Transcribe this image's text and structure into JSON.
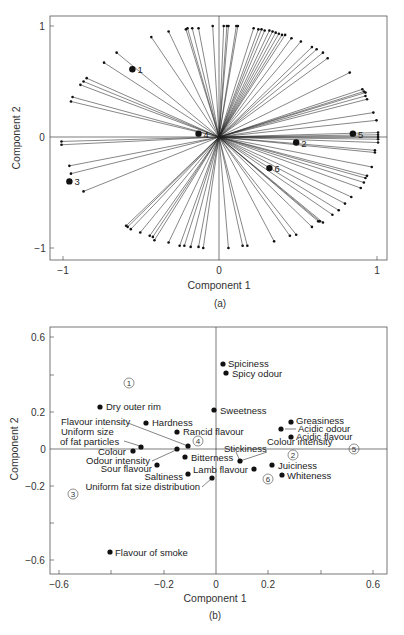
{
  "chart_data": [
    {
      "id": "a",
      "type": "scatter",
      "subtype": "biplot-loadings-vectors",
      "caption": "(a)",
      "xlabel": "Component 1",
      "ylabel": "Component 2",
      "xlim": [
        -1.1,
        1.07
      ],
      "ylim": [
        -1.1,
        1.09
      ],
      "xticks": [
        -1,
        0,
        1
      ],
      "xtick_labels": [
        "−1",
        "0",
        "1"
      ],
      "yticks": [
        -1,
        0,
        1
      ],
      "ytick_labels": [
        "−1",
        "0",
        "1"
      ],
      "grid": false,
      "reference_lines": {
        "x0": true,
        "y0": true
      },
      "labeled_points": [
        {
          "label": "1",
          "x": -0.55,
          "y": 0.61
        },
        {
          "label": "2",
          "x": 0.49,
          "y": -0.05
        },
        {
          "label": "3",
          "x": -0.95,
          "y": -0.4
        },
        {
          "label": "4",
          "x": -0.13,
          "y": 0.03
        },
        {
          "label": "5",
          "x": 0.85,
          "y": 0.03
        },
        {
          "label": "6",
          "x": 0.32,
          "y": -0.28
        }
      ],
      "vectors": [
        [
          -0.43,
          0.9
        ],
        [
          -0.32,
          0.95
        ],
        [
          -0.21,
          0.97
        ],
        [
          -0.2,
          0.98
        ],
        [
          -0.17,
          0.98
        ],
        [
          -0.13,
          0.98
        ],
        [
          -0.04,
          1.0
        ],
        [
          0.03,
          1.0
        ],
        [
          0.05,
          1.0
        ],
        [
          0.06,
          1.0
        ],
        [
          0.11,
          1.0
        ],
        [
          0.12,
          1.0
        ],
        [
          0.22,
          0.98
        ],
        [
          0.25,
          0.97
        ],
        [
          0.27,
          0.97
        ],
        [
          0.29,
          0.96
        ],
        [
          0.32,
          0.96
        ],
        [
          0.34,
          0.95
        ],
        [
          0.36,
          0.94
        ],
        [
          0.38,
          0.93
        ],
        [
          0.4,
          0.92
        ],
        [
          0.42,
          0.92
        ],
        [
          0.46,
          0.89
        ],
        [
          0.52,
          0.86
        ],
        [
          0.59,
          0.81
        ],
        [
          0.62,
          0.79
        ],
        [
          0.66,
          0.76
        ],
        [
          0.69,
          0.71
        ],
        [
          0.83,
          0.58
        ],
        [
          0.91,
          0.43
        ],
        [
          0.92,
          0.41
        ],
        [
          0.93,
          0.4
        ],
        [
          0.93,
          0.37
        ],
        [
          0.94,
          0.34
        ],
        [
          0.98,
          0.22
        ],
        [
          1.0,
          0.15
        ],
        [
          1.01,
          0.04
        ],
        [
          1.01,
          0.02
        ],
        [
          1.01,
          0.0
        ],
        [
          1.01,
          -0.02
        ],
        [
          1.01,
          -0.05
        ],
        [
          0.99,
          -0.12
        ],
        [
          0.99,
          -0.14
        ],
        [
          0.97,
          -0.27
        ],
        [
          0.94,
          -0.35
        ],
        [
          0.93,
          -0.37
        ],
        [
          0.92,
          -0.41
        ],
        [
          0.9,
          -0.46
        ],
        [
          0.84,
          -0.54
        ],
        [
          0.8,
          -0.6
        ],
        [
          0.76,
          -0.66
        ],
        [
          0.72,
          -0.7
        ],
        [
          0.66,
          -0.77
        ],
        [
          0.64,
          -0.76
        ],
        [
          0.63,
          -0.76
        ],
        [
          0.59,
          -0.81
        ],
        [
          0.49,
          -0.88
        ],
        [
          0.45,
          -0.89
        ],
        [
          0.35,
          -0.94
        ],
        [
          0.18,
          -0.98
        ],
        [
          0.15,
          -0.98
        ],
        [
          0.06,
          -1.0
        ],
        [
          -0.1,
          -1.0
        ],
        [
          -0.13,
          -0.99
        ],
        [
          -0.18,
          -0.99
        ],
        [
          -0.22,
          -0.98
        ],
        [
          -0.25,
          -0.98
        ],
        [
          -0.32,
          -0.95
        ],
        [
          -0.41,
          -0.93
        ],
        [
          -0.42,
          -0.9
        ],
        [
          -0.44,
          -0.89
        ],
        [
          -0.5,
          -0.86
        ],
        [
          -0.56,
          -0.83
        ],
        [
          -0.58,
          -0.81
        ],
        [
          -0.59,
          -0.8
        ],
        [
          -0.86,
          -0.49
        ],
        [
          -0.94,
          -0.33
        ],
        [
          -0.95,
          -0.26
        ],
        [
          -1.0,
          -0.07
        ],
        [
          -1.0,
          -0.04
        ],
        [
          -0.94,
          0.32
        ],
        [
          -0.93,
          0.36
        ],
        [
          -0.88,
          0.47
        ],
        [
          -0.86,
          0.5
        ],
        [
          -0.84,
          0.53
        ],
        [
          -0.73,
          0.67
        ],
        [
          -0.65,
          0.76
        ]
      ]
    },
    {
      "id": "b",
      "type": "scatter",
      "caption": "(b)",
      "xlabel": "Component 1",
      "ylabel": "Component 2",
      "xlim": [
        -0.63,
        0.66
      ],
      "ylim": [
        -0.67,
        0.65
      ],
      "xticks": [
        -0.6,
        -0.2,
        0,
        0.2,
        0.6
      ],
      "xtick_labels": [
        "−0.6",
        "−0.2",
        "0",
        "0.2",
        "0.6"
      ],
      "xticks_minor": [
        -0.4,
        0.4
      ],
      "yticks": [
        0.6,
        0.2,
        0,
        -0.2,
        -0.6
      ],
      "ytick_labels": [
        "0.6",
        "0.2",
        "0",
        "−0.2",
        "−0.6"
      ],
      "yticks_minor": [
        0.4,
        -0.4
      ],
      "grid": false,
      "reference_lines": {
        "x0": true,
        "y0": true
      },
      "points": [
        {
          "label": "Spiciness",
          "x": 0.03,
          "y": 0.46
        },
        {
          "label": "Spicy odour",
          "x": 0.04,
          "y": 0.41
        },
        {
          "label": "Dry outer rim",
          "x": -0.44,
          "y": 0.23
        },
        {
          "label": "Sweetness",
          "x": -0.01,
          "y": 0.21
        },
        {
          "label": "Hardness",
          "x": -0.27,
          "y": 0.14
        },
        {
          "label": "Rancid flavour",
          "x": -0.15,
          "y": 0.09
        },
        {
          "label": "Flavour intensity",
          "x": -0.11,
          "y": 0.02
        },
        {
          "label": "Uniform size of fat particles",
          "x": -0.29,
          "y": 0.01
        },
        {
          "label": "Colour",
          "x": -0.32,
          "y": -0.01
        },
        {
          "label": "Odour intensity",
          "x": -0.15,
          "y": 0.0
        },
        {
          "label": "Bitterness",
          "x": -0.12,
          "y": -0.04
        },
        {
          "label": "Sour flavour",
          "x": -0.23,
          "y": -0.09
        },
        {
          "label": "Saltiness",
          "x": -0.11,
          "y": -0.13
        },
        {
          "label": "Uniform fat size distribution",
          "x": -0.02,
          "y": -0.15
        },
        {
          "label": "Stickiness",
          "x": 0.09,
          "y": -0.07
        },
        {
          "label": "Colour intensity",
          "x": 0.09,
          "y": -0.07
        },
        {
          "label": "Lamb flavour",
          "x": 0.15,
          "y": -0.11
        },
        {
          "label": "Greasiness",
          "x": 0.29,
          "y": 0.15
        },
        {
          "label": "Acidic odour",
          "x": 0.25,
          "y": 0.11
        },
        {
          "label": "Acidic flavour",
          "x": 0.29,
          "y": 0.07
        },
        {
          "label": "Juiciness",
          "x": 0.21,
          "y": -0.09
        },
        {
          "label": "Whiteness",
          "x": 0.25,
          "y": -0.14
        },
        {
          "label": "Flavour of smoke",
          "x": -0.41,
          "y": -0.56
        }
      ],
      "sample_markers": [
        {
          "label": "1",
          "x": -0.33,
          "y": 0.36
        },
        {
          "label": "2",
          "x": 0.29,
          "y": -0.03
        },
        {
          "label": "3",
          "x": -0.55,
          "y": -0.24
        },
        {
          "label": "4",
          "x": -0.07,
          "y": 0.05
        },
        {
          "label": "5",
          "x": 0.53,
          "y": 0.01
        },
        {
          "label": "6",
          "x": 0.19,
          "y": -0.16
        }
      ]
    }
  ],
  "chart_a": {
    "caption": "(a)",
    "xlabel": "Component 1",
    "ylabel": "Component 2",
    "xticks": [
      "−1",
      "0",
      "1"
    ],
    "yticks": [
      "1",
      "0",
      "−1"
    ],
    "point_labels": [
      "1",
      "2",
      "3",
      "4",
      "5",
      "6"
    ]
  },
  "chart_b": {
    "caption": "(b)",
    "xlabel": "Component 1",
    "ylabel": "Component 2",
    "xticks": [
      "−0.6",
      "−0.2",
      "0",
      "0.2",
      "0.6"
    ],
    "yticks": [
      "0.6",
      "0.2",
      "0",
      "−0.2",
      "−0.6"
    ],
    "labels": {
      "spiciness": "Spiciness",
      "spicy_odour": "Spicy odour",
      "dry_outer_rim": "Dry outer rim",
      "sweetness": "Sweetness",
      "flavour_intensity": "Flavour intensity",
      "hardness": "Hardness",
      "rancid_flavour": "Rancid flavour",
      "uniform_size_1": "Uniform size",
      "uniform_size_2": "of fat particles",
      "colour": "Colour",
      "odour_intensity": "Odour intensity",
      "sour_flavour": "Sour flavour",
      "bitterness": "Bitterness",
      "saltiness": "Saltiness",
      "uniform_fat": "Uniform fat size distribution",
      "stickiness": "Stickiness",
      "colour_intensity": "Colour intensity",
      "lamb_flavour": "Lamb flavour",
      "greasiness": "Greasiness",
      "acidic_odour": "Acidic odour",
      "acidic_flavour": "Acidic flavour",
      "juiciness": "Juiciness",
      "whiteness": "Whiteness",
      "flavour_of_smoke": "Flavour of smoke"
    },
    "circles": [
      "1",
      "2",
      "3",
      "4",
      "5",
      "6"
    ]
  }
}
